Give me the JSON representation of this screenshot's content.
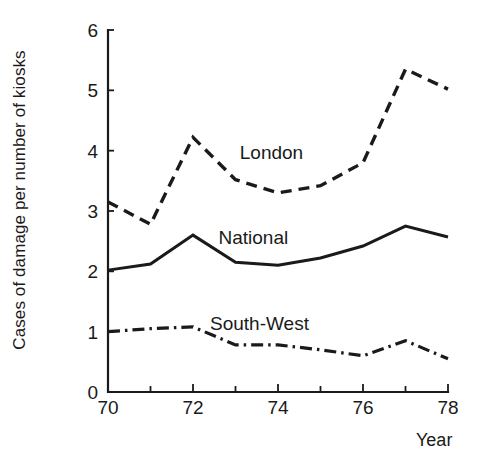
{
  "chart_data": {
    "type": "line",
    "title": "",
    "subtitle": "",
    "xlabel": "Year",
    "ylabel": "Cases of damage per number of kiosks",
    "x": [
      70,
      71,
      72,
      73,
      74,
      75,
      76,
      77,
      78
    ],
    "x_tick_labels": [
      "70",
      "72",
      "74",
      "76",
      "78"
    ],
    "x_major_ticks": [
      70,
      72,
      74,
      76,
      78
    ],
    "x_minor_ticks": [
      71,
      73,
      75,
      77
    ],
    "xlim": [
      70,
      78
    ],
    "y_tick_labels": [
      "0",
      "1",
      "2",
      "3",
      "4",
      "5",
      "6"
    ],
    "y_ticks": [
      0,
      1,
      2,
      3,
      4,
      5,
      6
    ],
    "ylim": [
      0,
      6
    ],
    "grid": false,
    "legend_position": "inline-annotations",
    "series": [
      {
        "name": "London",
        "style": "dashed",
        "color": "#1a1a1a",
        "values": [
          3.15,
          2.78,
          4.22,
          3.52,
          3.3,
          3.42,
          3.8,
          5.35,
          5.02
        ],
        "label_x": 73.1,
        "label_y": 3.87
      },
      {
        "name": "National",
        "style": "solid",
        "color": "#1a1a1a",
        "values": [
          2.02,
          2.12,
          2.6,
          2.15,
          2.1,
          2.22,
          2.42,
          2.75,
          2.57
        ],
        "label_x": 72.6,
        "label_y": 2.45
      },
      {
        "name": "South-West",
        "style": "dashdot",
        "color": "#1a1a1a",
        "values": [
          1.0,
          1.05,
          1.08,
          0.78,
          0.78,
          0.7,
          0.6,
          0.85,
          0.55
        ],
        "label_x": 72.4,
        "label_y": 1.02
      }
    ],
    "annotations": [
      {
        "text": "London",
        "x": 73.1,
        "y": 3.87
      },
      {
        "text": "National",
        "x": 72.6,
        "y": 2.45
      },
      {
        "text": "South-West",
        "x": 72.4,
        "y": 1.02
      }
    ],
    "axis_colors": {
      "axis": "#1a1a1a",
      "background": "#ffffff"
    }
  }
}
